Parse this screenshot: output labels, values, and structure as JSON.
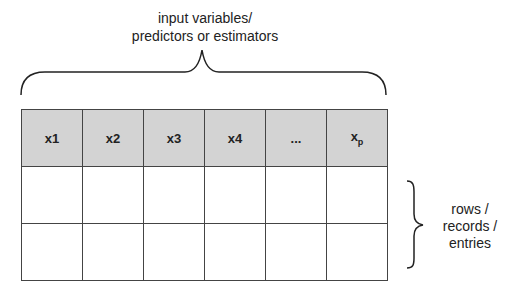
{
  "top_label": {
    "line1": "input variables/",
    "line2": "predictors or estimators"
  },
  "header": {
    "cells": [
      "x1",
      "x2",
      "x3",
      "x4",
      "...",
      "x"
    ],
    "last_subscript": "p",
    "fill_color": "#d3d3d3"
  },
  "rows": [
    [
      "",
      "",
      "",
      "",
      "",
      ""
    ],
    [
      "",
      "",
      "",
      "",
      "",
      ""
    ]
  ],
  "side_label": {
    "line1": "rows /",
    "line2": "records /",
    "line3": "entries"
  }
}
